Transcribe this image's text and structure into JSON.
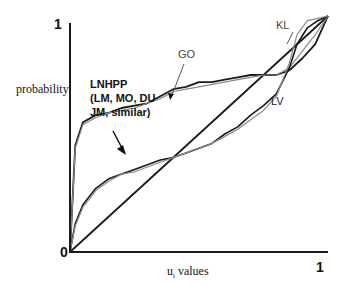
{
  "chart_data": {
    "type": "line",
    "title": "",
    "xlabel": "u_i values",
    "ylabel": "probability",
    "xlim": [
      0,
      1
    ],
    "ylim": [
      0,
      1
    ],
    "grid": false,
    "legend_position": "none",
    "x_ticks": [
      "0",
      "1"
    ],
    "y_ticks": [
      "0",
      "1"
    ],
    "annotations": [
      {
        "text": "LNHPP (LM, MO, DU JM, similar)",
        "arrow_to": [
          0.33,
          0.65
        ]
      },
      {
        "text": "GO",
        "arrow_to": [
          0.37,
          0.67
        ]
      },
      {
        "text": "KL",
        "arrow_to": [
          0.88,
          0.97
        ]
      },
      {
        "text": "LV",
        "near": [
          0.85,
          0.57
        ]
      }
    ],
    "series": [
      {
        "name": "Reference (y = x)",
        "x": [
          0,
          1
        ],
        "y": [
          0,
          1
        ]
      },
      {
        "name": "LNHPP (LM, MO, DU, JM, similar)",
        "x": [
          0,
          0.02,
          0.05,
          0.1,
          0.15,
          0.2,
          0.25,
          0.3,
          0.35,
          0.4,
          0.45,
          0.5,
          0.55,
          0.6,
          0.65,
          0.7,
          0.75,
          0.8,
          0.85,
          0.9,
          0.95,
          1.0
        ],
        "y": [
          0,
          0.45,
          0.55,
          0.58,
          0.59,
          0.61,
          0.62,
          0.63,
          0.66,
          0.69,
          0.7,
          0.72,
          0.72,
          0.73,
          0.74,
          0.75,
          0.75,
          0.75,
          0.77,
          0.82,
          0.88,
          1.0
        ]
      },
      {
        "name": "GO",
        "x": [
          0,
          0.02,
          0.05,
          0.1,
          0.15,
          0.2,
          0.25,
          0.3,
          0.35,
          0.4,
          0.45,
          0.5,
          0.55,
          0.6,
          0.65,
          0.7,
          0.75,
          0.8,
          0.85,
          0.9,
          0.95,
          1.0
        ],
        "y": [
          0,
          0.44,
          0.54,
          0.57,
          0.59,
          0.6,
          0.61,
          0.63,
          0.65,
          0.68,
          0.69,
          0.7,
          0.71,
          0.72,
          0.73,
          0.74,
          0.75,
          0.75,
          0.78,
          0.85,
          0.92,
          1.0
        ]
      },
      {
        "name": "LV",
        "x": [
          0,
          0.02,
          0.05,
          0.1,
          0.15,
          0.2,
          0.25,
          0.3,
          0.35,
          0.4,
          0.45,
          0.5,
          0.55,
          0.6,
          0.65,
          0.7,
          0.75,
          0.8,
          0.85,
          0.88,
          0.92,
          0.96,
          1.0
        ],
        "y": [
          0,
          0.12,
          0.2,
          0.27,
          0.31,
          0.33,
          0.35,
          0.37,
          0.39,
          0.4,
          0.42,
          0.44,
          0.46,
          0.5,
          0.53,
          0.58,
          0.62,
          0.67,
          0.78,
          0.88,
          0.95,
          0.98,
          1.0
        ]
      },
      {
        "name": "KL",
        "x": [
          0,
          0.02,
          0.05,
          0.1,
          0.15,
          0.2,
          0.25,
          0.3,
          0.35,
          0.4,
          0.45,
          0.5,
          0.55,
          0.6,
          0.65,
          0.7,
          0.75,
          0.8,
          0.85,
          0.88,
          0.92,
          0.96,
          1.0
        ],
        "y": [
          0,
          0.11,
          0.19,
          0.26,
          0.3,
          0.33,
          0.34,
          0.36,
          0.38,
          0.4,
          0.42,
          0.44,
          0.46,
          0.49,
          0.52,
          0.56,
          0.6,
          0.66,
          0.8,
          0.92,
          0.98,
          0.99,
          1.0
        ]
      }
    ]
  },
  "labels": {
    "y_top": "1",
    "origin": "0",
    "x_right": "1",
    "ylabel": "probability",
    "xlabel_main": "u",
    "xlabel_sub": "i",
    "xlabel_rest": " values",
    "lnhpp_line1": "LNHPP",
    "lnhpp_line2": "(LM, MO, DU",
    "lnhpp_line3": "JM, similar)",
    "go": "GO",
    "kl": "KL",
    "lv": "LV"
  },
  "colors": {
    "axis": "#1a1a1a",
    "dark_curve": "#1a1a1a",
    "light_curve": "#8a8a8a",
    "background": "#ffffff"
  }
}
